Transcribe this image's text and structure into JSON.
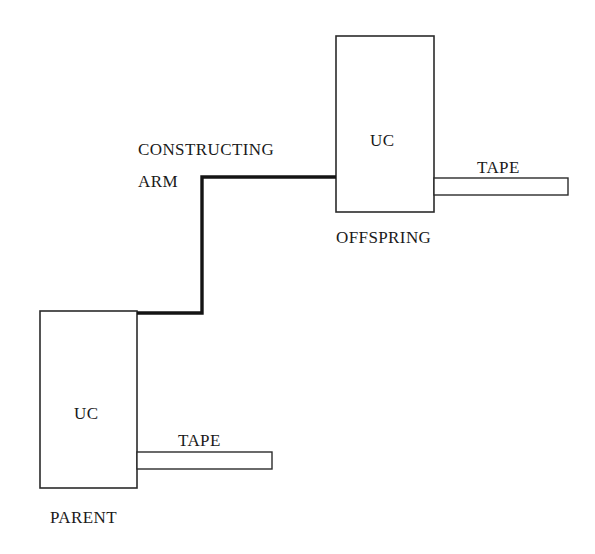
{
  "figure": {
    "background_color": "#ffffff",
    "stroke_color": "#1a1a1a",
    "arm_color": "#111111"
  },
  "labels": {
    "constructing_arm_line1": "CONSTRUCTING",
    "constructing_arm_line2": "ARM",
    "offspring_unit": "UC",
    "offspring_name": "OFFSPRING",
    "offspring_tape": "TAPE",
    "parent_unit": "UC",
    "parent_name": "PARENT",
    "parent_tape": "TAPE"
  },
  "shapes": {
    "offspring_box": {
      "x": 336,
      "y": 36,
      "width": 98,
      "height": 176
    },
    "offspring_tape_rect": {
      "x": 434,
      "y": 178,
      "width": 134,
      "height": 17
    },
    "parent_box": {
      "x": 40,
      "y": 311,
      "width": 97,
      "height": 177
    },
    "parent_tape_rect": {
      "x": 137,
      "y": 452,
      "width": 135,
      "height": 17
    },
    "constructing_arm_path": "M 137 313 L 202 313 L 202 177 L 336 177"
  }
}
